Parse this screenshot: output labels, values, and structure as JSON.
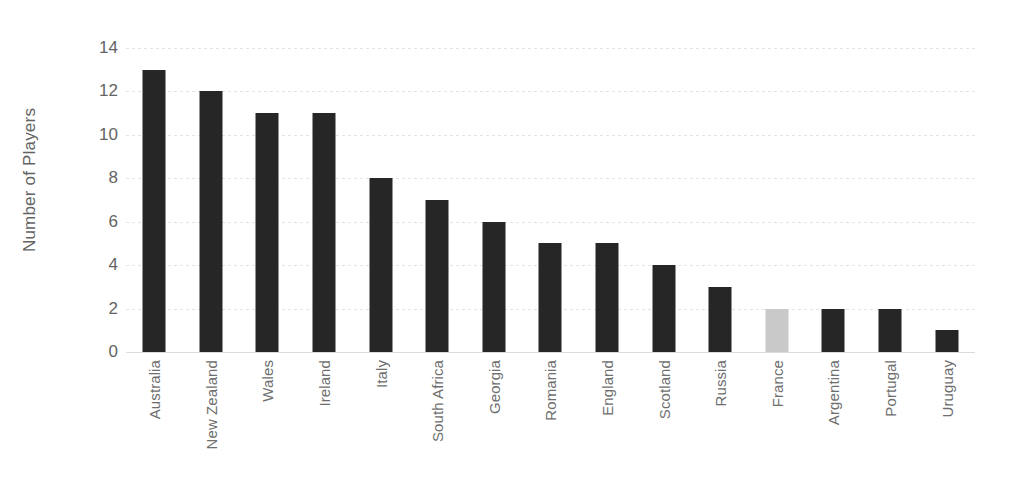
{
  "chart_data": {
    "type": "bar",
    "title": "",
    "subtitle": "",
    "xlabel": "",
    "ylabel": "Number of Players",
    "categories": [
      "Australia",
      "New Zealand",
      "Wales",
      "Ireland",
      "Italy",
      "South Africa",
      "Georgia",
      "Romania",
      "England",
      "Scotland",
      "Russia",
      "France",
      "Argentina",
      "Portugal",
      "Uruguay"
    ],
    "values": [
      13,
      12,
      11,
      11,
      8,
      7,
      6,
      5,
      5,
      4,
      3,
      2,
      2,
      2,
      1
    ],
    "bar_colors": [
      "#262626",
      "#262626",
      "#262626",
      "#262626",
      "#262626",
      "#262626",
      "#262626",
      "#262626",
      "#262626",
      "#262626",
      "#262626",
      "#c9c9c9",
      "#262626",
      "#262626",
      "#262626"
    ],
    "highlighted_category": "France",
    "ylim": [
      0,
      14
    ],
    "ytick_values": [
      0,
      2,
      4,
      6,
      8,
      10,
      12,
      14
    ],
    "ytick_labels": [
      "0",
      "2",
      "4",
      "6",
      "8",
      "10",
      "12",
      "14"
    ],
    "grid": true,
    "grid_axis": "y",
    "legend": false,
    "legend_position": "none",
    "annotations": [],
    "colors": {
      "bar_default": "#262626",
      "bar_highlight": "#c9c9c9",
      "gridline": "#e4e4e4",
      "baseline": "#dcdcdc",
      "tick_text": "#636363",
      "category_text": "#6e6e6e",
      "background": "#ffffff"
    }
  }
}
